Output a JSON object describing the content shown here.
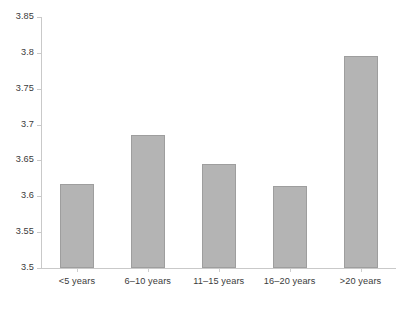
{
  "chart_data": {
    "type": "bar",
    "title": "",
    "subtitle": "",
    "xlabel": "",
    "ylabel": "",
    "categories": [
      "<5 years",
      "6–10 years",
      "11–15 years",
      "16–20 years",
      ">20 years"
    ],
    "values": [
      3.617,
      3.685,
      3.645,
      3.615,
      3.795
    ],
    "ylim": [
      3.5,
      3.85
    ],
    "yticks": [
      3.5,
      3.55,
      3.6,
      3.65,
      3.7,
      3.75,
      3.8,
      3.85
    ],
    "ytick_labels": [
      "3.5",
      "3.55",
      "3.6",
      "3.65",
      "3.7",
      "3.75",
      "3.8",
      "3.85"
    ],
    "grid": false,
    "legend": false,
    "legend_position": "none",
    "bar_color": "#b4b4b4",
    "bar_edge_color": "#9e9e9e",
    "axis_color": "#c9c9c9",
    "text_color": "#3b3b3b",
    "background": "#ffffff"
  }
}
